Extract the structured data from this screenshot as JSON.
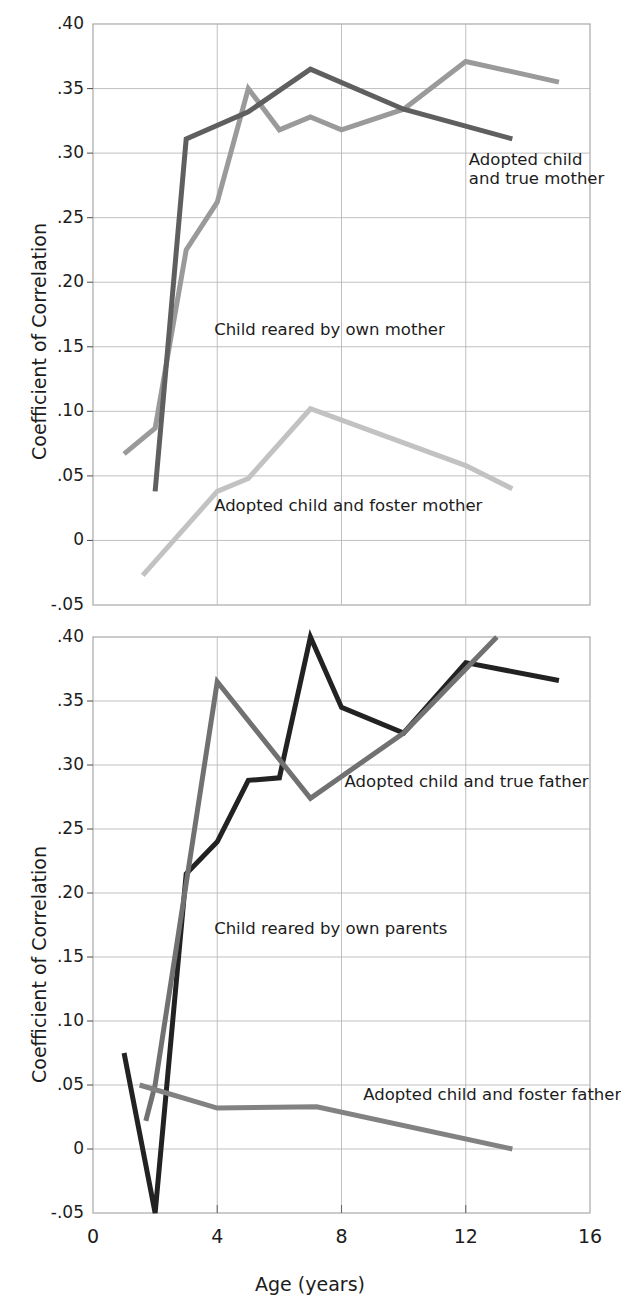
{
  "figure": {
    "axis_title_y": "Coefficient of Correlation",
    "axis_title_x": "Age (years)"
  },
  "chart_data": [
    {
      "type": "line",
      "id": "top",
      "title": "",
      "xlabel": "Age (years)",
      "ylabel": "Coefficient of Correlation",
      "xlim": [
        0,
        16
      ],
      "ylim": [
        -0.05,
        0.4
      ],
      "xticks": [
        0,
        4,
        8,
        12,
        16
      ],
      "xticklabels": [
        "0",
        "4",
        "8",
        "12",
        "16"
      ],
      "yticks": [
        -0.05,
        0,
        0.05,
        0.1,
        0.15,
        0.2,
        0.25,
        0.3,
        0.35,
        0.4
      ],
      "yticklabels": [
        "-.05",
        "0",
        ".05",
        ".10",
        ".15",
        ".20",
        ".25",
        ".30",
        ".35",
        ".40"
      ],
      "grid": true,
      "legend_position": "inline-annotations",
      "series": [
        {
          "name": "Adopted child and true mother",
          "color": "#9a9a9a",
          "points": [
            [
              1,
              0.067
            ],
            [
              2,
              0.087
            ],
            [
              3,
              0.225
            ],
            [
              4,
              0.262
            ],
            [
              5,
              0.35
            ],
            [
              6,
              0.318
            ],
            [
              7,
              0.328
            ],
            [
              8,
              0.318
            ],
            [
              10,
              0.334
            ],
            [
              12,
              0.371
            ],
            [
              15,
              0.355
            ]
          ]
        },
        {
          "name": "Child reared by own mother",
          "color": "#5f5f5f",
          "points": [
            [
              2,
              0.038
            ],
            [
              3,
              0.311
            ],
            [
              5,
              0.332
            ],
            [
              7,
              0.365
            ],
            [
              10,
              0.334
            ],
            [
              13.5,
              0.311
            ]
          ]
        },
        {
          "name": "Adopted child and foster mother",
          "color": "#c2c2c2",
          "points": [
            [
              1.6,
              -0.027
            ],
            [
              4,
              0.038
            ],
            [
              5,
              0.048
            ],
            [
              7,
              0.102
            ],
            [
              12,
              0.058
            ],
            [
              13.5,
              0.04
            ]
          ]
        }
      ],
      "annotations": [
        {
          "text": "Adopted child\nand true mother",
          "x": 12.1,
          "y": 0.295,
          "name": "label-adopted-true-mother"
        },
        {
          "text": "Child reared by own mother",
          "x": 3.9,
          "y": 0.163,
          "name": "label-own-mother"
        },
        {
          "text": "Adopted child and foster mother",
          "x": 3.9,
          "y": 0.027,
          "name": "label-foster-mother"
        }
      ]
    },
    {
      "type": "line",
      "id": "bottom",
      "title": "",
      "xlabel": "Age (years)",
      "ylabel": "Coefficient of Correlation",
      "xlim": [
        0,
        16
      ],
      "ylim": [
        -0.05,
        0.4
      ],
      "xticks": [
        0,
        4,
        8,
        12,
        16
      ],
      "xticklabels": [
        "0",
        "4",
        "8",
        "12",
        "16"
      ],
      "yticks": [
        -0.05,
        0,
        0.05,
        0.1,
        0.15,
        0.2,
        0.25,
        0.3,
        0.35,
        0.4
      ],
      "yticklabels": [
        "-.05",
        "0",
        ".05",
        ".10",
        ".15",
        ".20",
        ".25",
        ".30",
        ".35",
        ".40"
      ],
      "grid": true,
      "legend_position": "inline-annotations",
      "series": [
        {
          "name": "Child reared by own parents",
          "color": "#222222",
          "points": [
            [
              1,
              0.075
            ],
            [
              2,
              -0.05
            ],
            [
              3,
              0.215
            ],
            [
              4,
              0.24
            ],
            [
              5,
              0.288
            ],
            [
              6,
              0.29
            ],
            [
              7,
              0.4
            ],
            [
              8,
              0.345
            ],
            [
              10,
              0.325
            ],
            [
              12,
              0.38
            ],
            [
              15,
              0.366
            ]
          ]
        },
        {
          "name": "Adopted child and true father",
          "color": "#717171",
          "points": [
            [
              1.7,
              0.022
            ],
            [
              2,
              0.05
            ],
            [
              4,
              0.365
            ],
            [
              7,
              0.274
            ],
            [
              10,
              0.325
            ],
            [
              13,
              0.4
            ]
          ]
        },
        {
          "name": "Adopted child and foster father",
          "color": "#828282",
          "points": [
            [
              1.5,
              0.05
            ],
            [
              4,
              0.032
            ],
            [
              7.2,
              0.033
            ],
            [
              13.5,
              0.0
            ]
          ]
        }
      ],
      "annotations": [
        {
          "text": "Adopted child and true father",
          "x": 8.1,
          "y": 0.287,
          "name": "label-adopted-true-father"
        },
        {
          "text": "Child reared by own parents",
          "x": 3.9,
          "y": 0.172,
          "name": "label-own-parents"
        },
        {
          "text": "Adopted child and foster father",
          "x": 8.7,
          "y": 0.042,
          "name": "label-foster-father"
        }
      ]
    }
  ]
}
